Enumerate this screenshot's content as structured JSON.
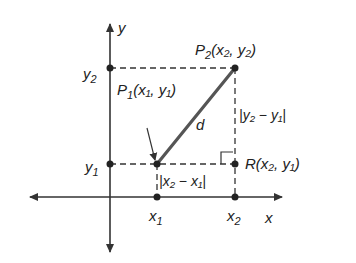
{
  "diagram": {
    "axes": {
      "x_label": "x",
      "y_label": "y"
    },
    "ticks": {
      "x1": "x",
      "x1_sub": "1",
      "x2": "x",
      "x2_sub": "2",
      "y1": "y",
      "y1_sub": "1",
      "y2": "y",
      "y2_sub": "2"
    },
    "points": {
      "P1": {
        "name": "P",
        "sub": "1",
        "coords": "(x₁, y₁)"
      },
      "P2": {
        "name": "P",
        "sub": "2",
        "coords": "(x₂, y₂)"
      },
      "R": {
        "name": "R",
        "coords": "(x₂, y₁)"
      }
    },
    "segment_label": "d",
    "horizontal_distance": "|x₂ − x₁|",
    "vertical_distance": "|y₂ − y₁|",
    "colors": {
      "axis": "#333333",
      "segment": "#555555",
      "dashed": "#333333"
    }
  }
}
